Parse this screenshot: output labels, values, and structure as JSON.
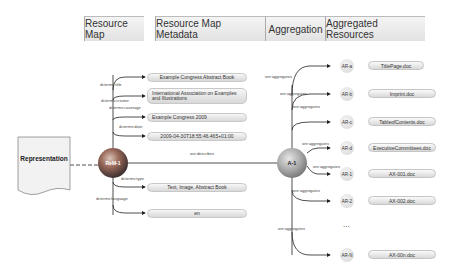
{
  "headers": {
    "resource_map": "Resource Map",
    "resource_map_metadata": "Resource Map Metadata",
    "aggregation": "Aggregation",
    "aggregated_resources": "Aggregated Resources"
  },
  "representation": {
    "label": "Representation"
  },
  "resource_map_node": {
    "label": "ReM-1",
    "color": "#c0504d"
  },
  "aggregation_node": {
    "label": "A-1",
    "color": "#999999"
  },
  "metadata": [
    {
      "predicate": "dcterms:title",
      "value": "Example Congress Abstract Book"
    },
    {
      "predicate": "dcterms:creator",
      "value": "International Association on Examples and Illustrations"
    },
    {
      "predicate": "dcterms:coverage",
      "value": "Example Congress 2009"
    },
    {
      "predicate": "dcterms:date",
      "value": "2009-04-30T18:55:46.465+01:00"
    },
    {
      "predicate": "dcterms:type",
      "value": "Text, Image, Abstract Book"
    },
    {
      "predicate": "dcterms:language",
      "value": "en"
    }
  ],
  "describes_label": "ore:describes",
  "aggregates_label": "ore:aggregates",
  "resources": [
    {
      "id": "AR-a",
      "file": "TitlePage.doc"
    },
    {
      "id": "AR-b",
      "file": "Imprint.doc"
    },
    {
      "id": "AR-c",
      "file": "TableofContents.doc"
    },
    {
      "id": "AR-d",
      "file": "ExecutiveCommittees.doc"
    },
    {
      "id": "AR-1",
      "file": "AX-001.doc"
    },
    {
      "id": "AR-2",
      "file": "AX-002.doc"
    },
    {
      "id": "AR-N",
      "file": "AX-00n.doc"
    }
  ],
  "ellipsis": "..."
}
